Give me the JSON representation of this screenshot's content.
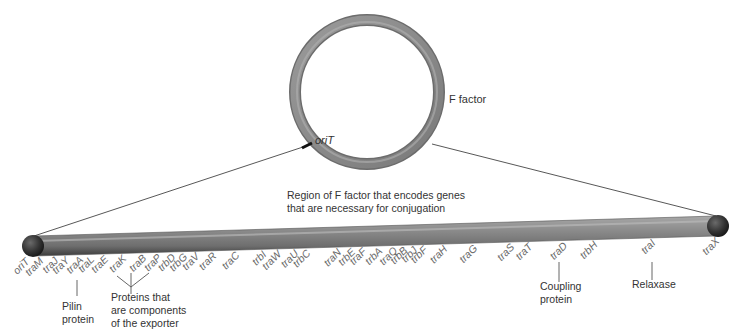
{
  "plasmid": {
    "label": "F factor",
    "origin_label": "oriT",
    "ring_color": "#8a8a8a"
  },
  "region_caption": {
    "line1": "Region of F factor that encodes genes",
    "line2": "that are necessary for conjugation"
  },
  "genes": [
    {
      "name": "oriT",
      "x": 30
    },
    {
      "name": "traM",
      "x": 44
    },
    {
      "name": "traJ",
      "x": 59
    },
    {
      "name": "traY",
      "x": 70
    },
    {
      "name": "traA",
      "x": 84
    },
    {
      "name": "traL",
      "x": 95
    },
    {
      "name": "traE",
      "x": 109
    },
    {
      "name": "traK",
      "x": 127
    },
    {
      "name": "traB",
      "x": 147
    },
    {
      "name": "traP",
      "x": 162
    },
    {
      "name": "trbD",
      "x": 176
    },
    {
      "name": "trbG",
      "x": 188
    },
    {
      "name": "traV",
      "x": 200
    },
    {
      "name": "traR",
      "x": 217
    },
    {
      "name": "traC",
      "x": 240
    },
    {
      "name": "trbI",
      "x": 267
    },
    {
      "name": "traW",
      "x": 282
    },
    {
      "name": "traU",
      "x": 299
    },
    {
      "name": "trbC",
      "x": 311
    },
    {
      "name": "traN",
      "x": 342
    },
    {
      "name": "trbE",
      "x": 356
    },
    {
      "name": "traF",
      "x": 367
    },
    {
      "name": "trbA",
      "x": 383
    },
    {
      "name": "traQ",
      "x": 398
    },
    {
      "name": "trbB",
      "x": 408
    },
    {
      "name": "trbJ",
      "x": 418
    },
    {
      "name": "trbF",
      "x": 428
    },
    {
      "name": "traH",
      "x": 448
    },
    {
      "name": "traG",
      "x": 478
    },
    {
      "name": "traS",
      "x": 515
    },
    {
      "name": "traT",
      "x": 533
    },
    {
      "name": "traD",
      "x": 568
    },
    {
      "name": "trbH",
      "x": 598
    },
    {
      "name": "traI",
      "x": 656
    },
    {
      "name": "traX",
      "x": 720
    }
  ],
  "annotations": {
    "pilin": {
      "line1": "Pilin",
      "line2": "protein"
    },
    "exporter": {
      "line1": "Proteins that",
      "line2": "are components",
      "line3": "of the exporter"
    },
    "coupling": {
      "line1": "Coupling",
      "line2": "protein"
    },
    "relaxase": {
      "line1": "Relaxase"
    }
  }
}
